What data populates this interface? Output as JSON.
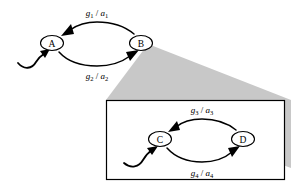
{
  "figure": {
    "name": "hierarchical-state-machine-zoom",
    "background_color": "#ffffff",
    "cone_color": "#c8c8c8",
    "stroke_color": "#000000",
    "node_fill": "#ffffff"
  },
  "outer_machine": {
    "name": "outer-state-machine",
    "states": [
      {
        "id": "A",
        "label": "A",
        "cx": 52,
        "cy": 43
      },
      {
        "id": "B",
        "label": "B",
        "cx": 141,
        "cy": 43
      }
    ],
    "initial_state": "A",
    "transitions": [
      {
        "id": "t1",
        "from": "B",
        "to": "A",
        "guard": "g",
        "guard_sub": "1",
        "separator": "/",
        "action": "a",
        "action_sub": "1",
        "label_text": "g1 / a1",
        "label_x": 97,
        "label_y": 19
      },
      {
        "id": "t2",
        "from": "A",
        "to": "B",
        "guard": "g",
        "guard_sub": "2",
        "separator": "/",
        "action": "a",
        "action_sub": "2",
        "label_text": "g2 / a2",
        "label_x": 97,
        "label_y": 77
      }
    ]
  },
  "inset_machine": {
    "name": "inset-state-machine",
    "frame": {
      "x": 106,
      "y": 100,
      "width": 179,
      "height": 80
    },
    "states": [
      {
        "id": "C",
        "label": "C",
        "cx": 160,
        "cy": 139
      },
      {
        "id": "D",
        "label": "D",
        "cx": 243,
        "cy": 139
      }
    ],
    "initial_state": "C",
    "transitions": [
      {
        "id": "t3",
        "from": "D",
        "to": "C",
        "guard": "g",
        "guard_sub": "3",
        "separator": "/",
        "action": "a",
        "action_sub": "3",
        "label_text": "g3 / a3",
        "label_x": 202,
        "label_y": 115
      },
      {
        "id": "t4",
        "from": "C",
        "to": "D",
        "guard": "g",
        "guard_sub": "4",
        "separator": "/",
        "action": "a",
        "action_sub": "4",
        "label_text": "g4 / a4",
        "label_x": 202,
        "label_y": 174
      }
    ]
  },
  "zoom_cone": {
    "name": "magnification-cone",
    "color": "#c8c8c8",
    "apex_x": 148,
    "apex_y": 44
  }
}
